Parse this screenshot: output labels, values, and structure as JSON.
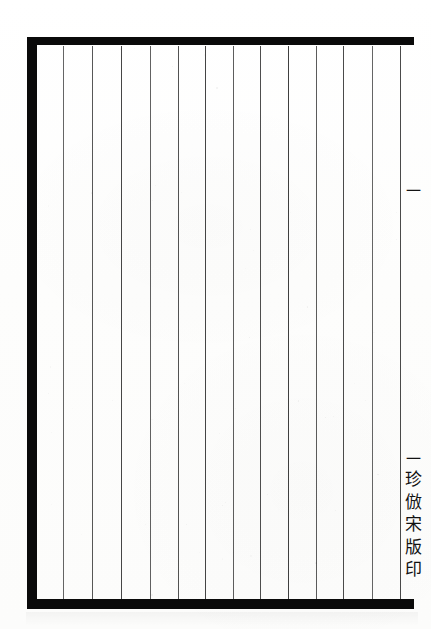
{
  "document": {
    "kind": "scanned-book-page",
    "description": "Blank ruled page from a traditional Chinese thread-bound block-printed book",
    "page_width": 431,
    "page_height": 629,
    "background_color": "#fdfdfd",
    "ink_color": "#0a0a0a"
  },
  "frame": {
    "name": "printed-border",
    "top_rule": {
      "x": 27,
      "y": 37,
      "width": 387,
      "height": 8
    },
    "left_rule": {
      "x": 27,
      "y": 37,
      "width": 10,
      "height": 572
    },
    "bottom_rule": {
      "x": 27,
      "y": 599,
      "width": 387,
      "height": 10
    },
    "color": "#0a0a0a"
  },
  "columns": {
    "name": "vertical-writing-columns",
    "count": 13,
    "rule_color": "#2a2a2a",
    "rule_top": 46,
    "rule_height": 553,
    "x_positions": [
      63,
      92,
      121,
      150,
      178,
      205,
      233,
      260,
      288,
      316,
      343,
      372,
      400
    ]
  },
  "banxin": {
    "name": "centre-column",
    "volume_mark": "一",
    "imprint_glyphs": [
      "一",
      "珍",
      "倣",
      "宋",
      "版",
      "印"
    ],
    "imprint_text": "一珍倣宋版印",
    "imprint_reading": "vertical, top to bottom"
  },
  "content": {
    "body_text": "",
    "note": "page is blank — only ruling and centre-column imprint are printed"
  }
}
